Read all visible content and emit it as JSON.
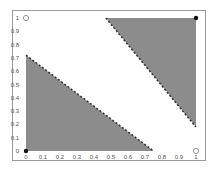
{
  "chart_data": {
    "type": "area",
    "title": "",
    "xlabel": "",
    "ylabel": "",
    "xlim": [
      0,
      1
    ],
    "ylim": [
      0,
      1
    ],
    "grid": false,
    "x_ticks": [
      "0",
      "0.1",
      "0.2",
      "0.3",
      "0.4",
      "0.5",
      "0.6",
      "0.7",
      "0.8",
      "0.9",
      "1"
    ],
    "y_ticks": [
      "0",
      "0.1",
      "0.2",
      "0.3",
      "0.4",
      "0.5",
      "0.6",
      "0.7",
      "0.8",
      "0.9",
      "1"
    ],
    "regions": [
      {
        "name": "lower-left triangle",
        "vertices": [
          [
            0,
            0
          ],
          [
            0,
            0.72
          ],
          [
            0.75,
            0
          ]
        ],
        "fill": "#8c8c8c",
        "boundary": "dashed hypotenuse"
      },
      {
        "name": "upper-right triangle",
        "vertices": [
          [
            0.47,
            1
          ],
          [
            1,
            1
          ],
          [
            1,
            0.18
          ]
        ],
        "fill": "#8c8c8c",
        "boundary": "dashed hypotenuse"
      }
    ],
    "points": [
      {
        "x": 0,
        "y": 0,
        "style": "filled"
      },
      {
        "x": 1,
        "y": 1,
        "style": "filled"
      },
      {
        "x": 0,
        "y": 1,
        "style": "open"
      },
      {
        "x": 1,
        "y": 0,
        "style": "open"
      }
    ]
  },
  "colors": {
    "fill": "#8c8c8c",
    "dash": "#333333",
    "frame": "#9a9a9a",
    "text": "#555555"
  }
}
